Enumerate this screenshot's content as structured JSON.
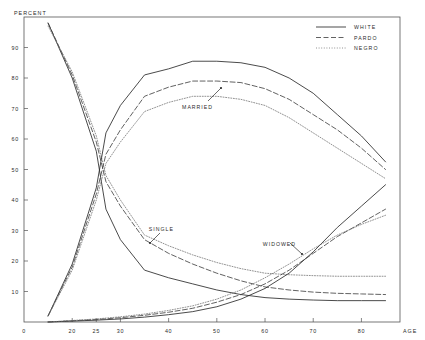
{
  "chart_data": {
    "type": "line",
    "title": "",
    "xlabel": "AGE",
    "ylabel": "PERCENT",
    "xlim": [
      10,
      88
    ],
    "ylim": [
      0,
      100
    ],
    "grid": false,
    "legend_position": "top-right",
    "x_ticks": [
      {
        "value": 10,
        "label": "0"
      },
      {
        "value": 20,
        "label": "20"
      },
      {
        "value": 25,
        "label": "25"
      },
      {
        "value": 30,
        "label": "30"
      },
      {
        "value": 40,
        "label": "40"
      },
      {
        "value": 50,
        "label": "50"
      },
      {
        "value": 60,
        "label": "60"
      },
      {
        "value": 70,
        "label": "70"
      },
      {
        "value": 80,
        "label": "80"
      }
    ],
    "y_ticks": [
      {
        "value": 10,
        "label": "10"
      },
      {
        "value": 20,
        "label": "20"
      },
      {
        "value": 30,
        "label": "30"
      },
      {
        "value": 40,
        "label": "40"
      },
      {
        "value": 50,
        "label": "50"
      },
      {
        "value": 60,
        "label": "60"
      },
      {
        "value": 70,
        "label": "70"
      },
      {
        "value": 80,
        "label": "80"
      },
      {
        "value": 90,
        "label": "90"
      }
    ],
    "legend": [
      {
        "name": "WHITE",
        "style": "solid"
      },
      {
        "name": "PARDO",
        "style": "dashed"
      },
      {
        "name": "NEGRO",
        "style": "dotted"
      }
    ],
    "annotations": [
      {
        "text": "MARRIED",
        "x": 46,
        "y": 70
      },
      {
        "text": "SINGLE",
        "x": 38.5,
        "y": 30
      },
      {
        "text": "WIDOWED",
        "x": 63,
        "y": 25
      }
    ],
    "series": [
      {
        "name": "SINGLE WHITE",
        "group": "SINGLE",
        "race": "WHITE",
        "style": "solid",
        "x": [
          15,
          20,
          25,
          27,
          30,
          35,
          40,
          45,
          50,
          55,
          60,
          65,
          70,
          75,
          80,
          85
        ],
        "values": [
          98,
          80,
          56,
          37,
          27,
          17,
          14.5,
          12.5,
          10.5,
          9,
          8,
          7.5,
          7.2,
          7,
          7,
          7
        ]
      },
      {
        "name": "SINGLE PARDO",
        "group": "SINGLE",
        "race": "PARDO",
        "style": "dashed",
        "x": [
          15,
          20,
          25,
          27,
          30,
          35,
          40,
          45,
          50,
          55,
          60,
          65,
          70,
          75,
          80,
          85
        ],
        "values": [
          98,
          81,
          59,
          46,
          38,
          27,
          22.5,
          19,
          16,
          13.5,
          11.5,
          10.5,
          9.8,
          9.4,
          9.2,
          9
        ]
      },
      {
        "name": "SINGLE NEGRO",
        "group": "SINGLE",
        "race": "NEGRO",
        "style": "dotted",
        "x": [
          15,
          20,
          25,
          27,
          30,
          35,
          40,
          45,
          50,
          55,
          60,
          65,
          70,
          75,
          80,
          85
        ],
        "values": [
          97,
          82,
          61,
          48,
          40,
          28.5,
          25,
          22,
          19.5,
          17.5,
          16,
          15.5,
          15.2,
          15,
          15,
          15
        ]
      },
      {
        "name": "MARRIED WHITE",
        "group": "MARRIED",
        "race": "WHITE",
        "style": "solid",
        "x": [
          15,
          20,
          25,
          27,
          30,
          35,
          40,
          45,
          50,
          55,
          60,
          65,
          70,
          75,
          80,
          85
        ],
        "values": [
          2,
          19,
          44,
          62,
          71,
          81,
          83,
          85.5,
          85.5,
          85,
          83.5,
          80,
          75,
          68,
          61,
          52.5
        ]
      },
      {
        "name": "MARRIED PARDO",
        "group": "MARRIED",
        "race": "PARDO",
        "style": "dashed",
        "x": [
          15,
          20,
          25,
          27,
          30,
          35,
          40,
          45,
          50,
          55,
          60,
          65,
          70,
          75,
          80,
          85
        ],
        "values": [
          2,
          18,
          42,
          55,
          63,
          74,
          77,
          79,
          79,
          78.5,
          76.5,
          73,
          68,
          63,
          57,
          50
        ]
      },
      {
        "name": "MARRIED NEGRO",
        "group": "MARRIED",
        "race": "NEGRO",
        "style": "dotted",
        "x": [
          15,
          20,
          25,
          27,
          30,
          35,
          40,
          45,
          50,
          55,
          60,
          65,
          70,
          75,
          80,
          85
        ],
        "values": [
          2,
          17,
          40,
          52,
          59,
          69,
          72,
          74,
          74,
          73,
          71,
          67,
          62,
          57,
          52,
          47
        ]
      },
      {
        "name": "WIDOWED WHITE",
        "group": "WIDOWED",
        "race": "WHITE",
        "style": "solid",
        "x": [
          15,
          20,
          25,
          30,
          35,
          40,
          45,
          50,
          55,
          60,
          65,
          70,
          75,
          80,
          85
        ],
        "values": [
          0,
          0.3,
          0.6,
          1,
          1.6,
          2.4,
          3.4,
          5,
          7.5,
          11,
          16,
          23,
          31,
          38,
          45
        ]
      },
      {
        "name": "WIDOWED PARDO",
        "group": "WIDOWED",
        "race": "PARDO",
        "style": "dashed",
        "x": [
          15,
          20,
          25,
          30,
          35,
          40,
          45,
          50,
          55,
          60,
          65,
          70,
          75,
          80,
          85
        ],
        "values": [
          0,
          0.4,
          0.8,
          1.4,
          2.2,
          3.2,
          4.5,
          6.5,
          9,
          12.5,
          17,
          22.5,
          28,
          32.5,
          37
        ]
      },
      {
        "name": "WIDOWED NEGRO",
        "group": "WIDOWED",
        "race": "NEGRO",
        "style": "dotted",
        "x": [
          15,
          20,
          25,
          30,
          35,
          40,
          45,
          50,
          55,
          60,
          65,
          70,
          75,
          80,
          85
        ],
        "values": [
          0,
          0.5,
          1,
          1.7,
          2.6,
          3.8,
          5.3,
          7.5,
          10.5,
          14.5,
          19,
          24,
          28.5,
          32,
          35
        ]
      }
    ]
  }
}
